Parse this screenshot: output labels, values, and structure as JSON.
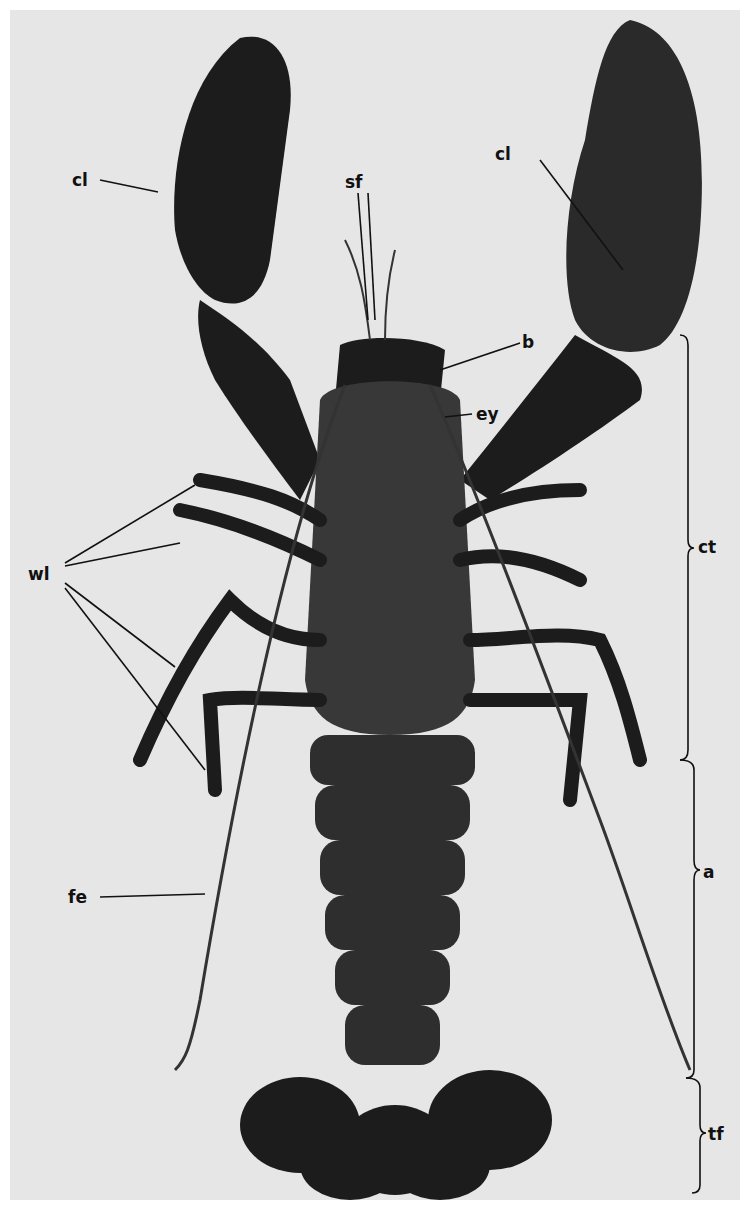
{
  "figure": {
    "background_color": "#e6e6e6",
    "specimen_color": "#1a1a1a",
    "labels": {
      "claw_left": "cl",
      "claw_right": "cl",
      "antennules": "sf",
      "rostrum": "b",
      "eye": "ey",
      "walking_legs": "wl",
      "antenna": "fe",
      "cephalothorax": "ct",
      "abdomen": "a",
      "tail_fan": "tf"
    }
  }
}
